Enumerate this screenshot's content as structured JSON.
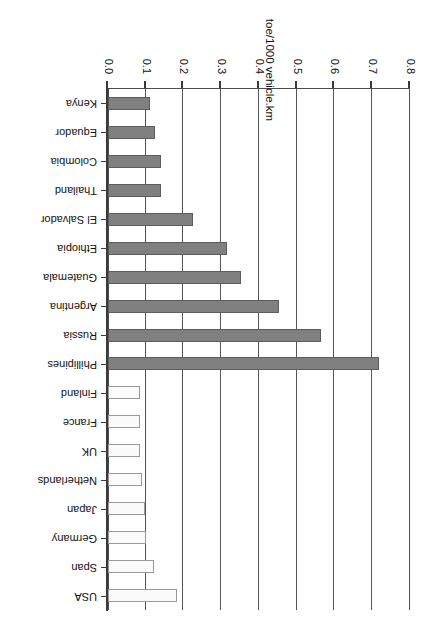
{
  "chart_data": {
    "type": "bar",
    "title": "",
    "subtitle": "",
    "xlabel": "",
    "ylabel": "toe/1000 vehicle.km",
    "ylim": [
      0.0,
      0.8
    ],
    "ytick_labels": [
      "0.0",
      "0.1",
      "0.2",
      "0.3",
      "0.4",
      "0.5",
      "0.6",
      "0.7",
      "0.8"
    ],
    "ytick_values": [
      0.0,
      0.1,
      0.2,
      0.3,
      0.4,
      0.5,
      0.6,
      0.7,
      0.8
    ],
    "grid": true,
    "legend": "none",
    "orientation": "vertical-bars-rotated-90",
    "categories": [
      "Kenya",
      "Equador",
      "Colombia",
      "Thailand",
      "El Salvador",
      "Ethiopia",
      "Guatemala",
      "Argentina",
      "Russia",
      "Phillipines",
      "Finland",
      "France",
      "UK",
      "Netherlands",
      "Japan",
      "Germany",
      "Span",
      "USA"
    ],
    "values": [
      0.11,
      0.125,
      0.14,
      0.14,
      0.225,
      0.315,
      0.352,
      0.452,
      0.563,
      0.718,
      0.086,
      0.086,
      0.086,
      0.09,
      0.098,
      0.1,
      0.122,
      0.184
    ],
    "bar_styles": [
      "dark",
      "dark",
      "dark",
      "dark",
      "dark",
      "dark",
      "dark",
      "dark",
      "dark",
      "dark",
      "light",
      "light",
      "light",
      "light",
      "light",
      "light",
      "light",
      "light"
    ],
    "colors": {
      "dark_bar_fill": "#808080",
      "dark_bar_border": "#5c5c5c",
      "light_bar_fill": "#fbfbfb",
      "light_bar_border": "#9a9a9a",
      "gridline": "#555555",
      "axis": "#3a3a3a",
      "text": "#111111",
      "background": "#ffffff"
    }
  }
}
